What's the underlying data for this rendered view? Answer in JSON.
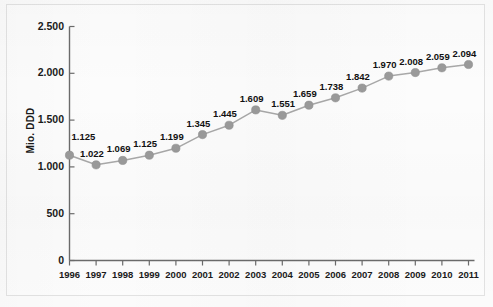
{
  "chart_data": {
    "type": "line",
    "title": "",
    "xlabel": "",
    "ylabel": "Mio. DDD",
    "categories": [
      "1996",
      "1997",
      "1998",
      "1999",
      "2000",
      "2001",
      "2002",
      "2003",
      "2004",
      "2005",
      "2006",
      "2007",
      "2008",
      "2009",
      "2010",
      "2011"
    ],
    "values": [
      1125,
      1022,
      1069,
      1125,
      1199,
      1345,
      1445,
      1609,
      1551,
      1659,
      1738,
      1842,
      1970,
      2008,
      2059,
      2094
    ],
    "value_labels": [
      "1.125",
      "1.022",
      "1.069",
      "1.125",
      "1.199",
      "1.345",
      "1.445",
      "1.609",
      "1.551",
      "1.659",
      "1.738",
      "1.842",
      "1.970",
      "2.008",
      "2.059",
      "2.094"
    ],
    "ylim": [
      0,
      2500
    ],
    "ytick_values": [
      0,
      500,
      1000,
      1500,
      2000,
      2500
    ],
    "ytick_labels": [
      "0",
      "500",
      "1.000",
      "1.500",
      "2.000",
      "2.500"
    ],
    "grid": false,
    "legend": null,
    "series_color": "#9a9a9a",
    "line_color": "#a8a8a8",
    "axis_color": "#6b6b6b",
    "text_color": "#111111",
    "background_color": "#fbfbfb"
  }
}
